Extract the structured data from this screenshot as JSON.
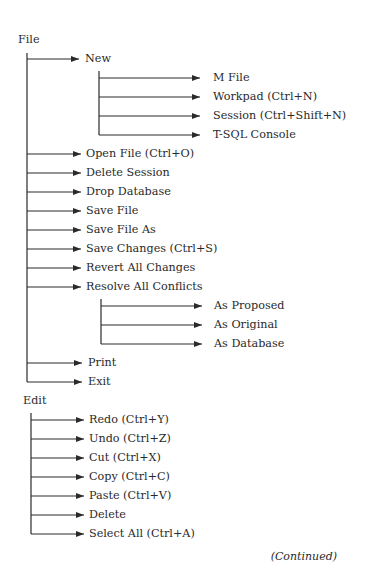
{
  "menus": [
    {
      "label": "File",
      "items": [
        {
          "label": "New",
          "children": [
            {
              "label": "M File"
            },
            {
              "label": "Workpad (Ctrl+N)"
            },
            {
              "label": "Session (Ctrl+Shift+N)"
            },
            {
              "label": "T-SQL Console"
            }
          ]
        },
        {
          "label": "Open File (Ctrl+O)"
        },
        {
          "label": "Delete Session"
        },
        {
          "label": "Drop Database"
        },
        {
          "label": "Save File"
        },
        {
          "label": "Save File As"
        },
        {
          "label": "Save Changes (Ctrl+S)"
        },
        {
          "label": "Revert All Changes"
        },
        {
          "label": "Resolve All Conflicts",
          "children": [
            {
              "label": "As Proposed"
            },
            {
              "label": "As Original"
            },
            {
              "label": "As Database"
            }
          ]
        },
        {
          "label": "Print"
        },
        {
          "label": "Exit"
        }
      ]
    },
    {
      "label": "Edit",
      "items": [
        {
          "label": "Redo (Ctrl+Y)"
        },
        {
          "label": "Undo (Ctrl+Z)"
        },
        {
          "label": "Cut (Ctrl+X)"
        },
        {
          "label": "Copy (Ctrl+C)"
        },
        {
          "label": "Paste (Ctrl+V)"
        },
        {
          "label": "Delete"
        },
        {
          "label": "Select All (Ctrl+A)"
        }
      ]
    }
  ],
  "footer": {
    "continued": "(Continued)"
  },
  "colors": {
    "ink": "#2a2a2a",
    "background": "#ffffff"
  }
}
